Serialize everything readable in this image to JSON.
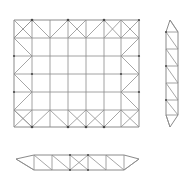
{
  "document": {
    "title": "Truss Structure Orthographic Views",
    "description": "Technical line drawing of a space-frame truss shown in three views",
    "background_color": "#ffffff",
    "line_color": "#8a8a8a",
    "node_color": "#4a4a4a",
    "canvas": {
      "width": 187,
      "height": 183
    }
  },
  "views": [
    {
      "id": "plan-view",
      "name": "Plan View",
      "role": "main rectangular truss grid",
      "bounds": {
        "x": 14,
        "y": 20,
        "width": 125,
        "height": 107
      },
      "grid": {
        "columns": 7,
        "rows": 6
      },
      "notes": "Rectangular perimeter with zig-zag diagonal bracing along all four edges and an open un-braced center field"
    },
    {
      "id": "right-elevation",
      "name": "Right Elevation",
      "role": "narrow vertical side truss",
      "bounds": {
        "x": 160,
        "y": 20,
        "width": 18,
        "height": 107
      },
      "grid": {
        "columns": 1,
        "rows": 6
      },
      "notes": "Tall slender truss with single diagonal per bay and tapered pointed top and bottom ends"
    },
    {
      "id": "bottom-elevation",
      "name": "Bottom Elevation",
      "role": "shallow horizontal bottom truss",
      "bounds": {
        "x": 16,
        "y": 152,
        "width": 123,
        "height": 20
      },
      "grid": {
        "columns": 7,
        "rows": 1
      },
      "notes": "Shallow truss with diagonal webs and tapered pointed left and right ends"
    }
  ],
  "geometry": {
    "plan": {
      "x_stations": [
        14,
        32,
        50,
        68,
        86,
        104,
        121,
        139
      ],
      "y_stations": [
        20,
        38,
        56,
        74,
        92,
        110,
        127
      ],
      "top_nodes_x": [
        32,
        68,
        104,
        139
      ],
      "bottom_nodes_x": [
        32,
        68,
        86,
        104,
        121
      ],
      "left_nodes_y": [
        38,
        56,
        74,
        92,
        110
      ],
      "right_nodes_y": [
        38,
        56,
        74,
        92,
        110
      ]
    },
    "right_panel": {
      "x_left": 160,
      "x_right": 178,
      "y_stations": [
        20,
        38,
        56,
        74,
        92,
        110,
        127
      ],
      "apex_top_y": 20,
      "apex_bottom_y": 127
    },
    "bottom_panel": {
      "x_stations": [
        16,
        34,
        52,
        70,
        88,
        106,
        124,
        139
      ],
      "y_top": 155,
      "y_bottom": 170,
      "left_apex_x": 16,
      "right_apex_x": 139
    }
  }
}
